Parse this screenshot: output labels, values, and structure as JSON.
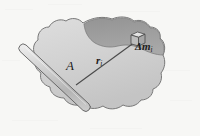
{
  "figure": {
    "kind": "physics-diagram",
    "background_color": "#f7f7f5",
    "labels": {
      "axis_label": "A",
      "radius_vector_label": "r",
      "radius_vector_subscript": "i",
      "mass_element_label": "Δm",
      "mass_element_subscript": "i"
    },
    "colors": {
      "body_fill": "#cfcfcf",
      "body_fill_light": "#d9d9d9",
      "body_shade_dark": "#9a9a9a",
      "body_outline": "#6e6e6e",
      "rod_fill": "#c6c6c6",
      "rod_outline": "#5d5d5d",
      "line_color": "#4a4a4a",
      "text_color": "#1c1c1c"
    },
    "elements": {
      "blob": "irregular-rigid-body",
      "rod": "rotation-axis-rod",
      "dashed_line": "axis-of-rotation-dashed",
      "cube": "mass-element-cube",
      "vector_line": "position-vector-line"
    }
  }
}
